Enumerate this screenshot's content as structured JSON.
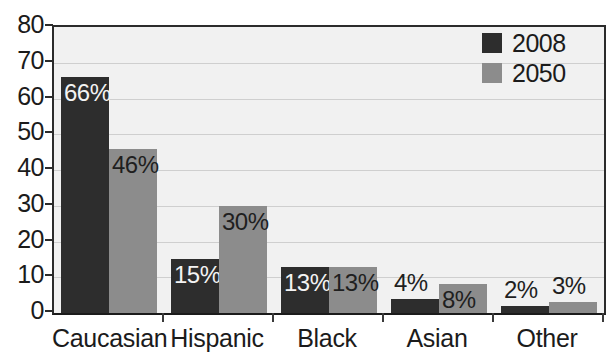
{
  "chart_data": {
    "type": "bar",
    "title": "",
    "subtitle": "",
    "xlabel": "",
    "ylabel": "",
    "categories": [
      "Caucasian",
      "Hispanic",
      "Black",
      "Asian",
      "Other"
    ],
    "series": [
      {
        "name": "2008",
        "color": "#2d2d2d",
        "values": [
          66,
          15,
          13,
          4,
          2
        ],
        "point_labels": [
          "66%",
          "15%",
          "13%",
          "4%",
          "2%"
        ],
        "label_placement": [
          "inside-dark",
          "inside-dark",
          "inside-dark",
          "above",
          "above"
        ]
      },
      {
        "name": "2050",
        "color": "#8c8c8c",
        "values": [
          46,
          30,
          13,
          8,
          3
        ],
        "point_labels": [
          "46%",
          "30%",
          "13%",
          "8%",
          "3%"
        ],
        "label_placement": [
          "inside-light",
          "inside-light",
          "inside-light",
          "inside-light",
          "above"
        ]
      }
    ],
    "ylim": [
      0,
      80
    ],
    "yticks": [
      0,
      10,
      20,
      30,
      40,
      50,
      60,
      70,
      80
    ],
    "ytick_labels": [
      "0",
      "10",
      "20",
      "30",
      "40",
      "50",
      "60",
      "70",
      "80"
    ],
    "grid": true,
    "grid_axis": "y",
    "legend": {
      "position": "top-right",
      "entries": [
        {
          "label": "2008",
          "color": "#2d2d2d"
        },
        {
          "label": "2050",
          "color": "#8c8c8c"
        }
      ]
    },
    "plot_background": "#f1f1f1",
    "axis_color": "#2b2b2b"
  }
}
